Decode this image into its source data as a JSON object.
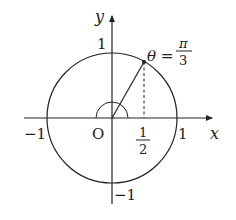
{
  "diagram": {
    "type": "unit-circle",
    "axes": {
      "x_label": "x",
      "y_label": "y",
      "origin_label": "O"
    },
    "ticks": {
      "x_neg": "−1",
      "x_pos": "1",
      "y_pos": "1",
      "y_neg": "−1",
      "half_num": "1",
      "half_den": "2"
    },
    "angle": {
      "lhs": "θ =",
      "num": "π",
      "den": "3"
    },
    "colors": {
      "stroke": "#222222",
      "background": "#ffffff"
    }
  }
}
